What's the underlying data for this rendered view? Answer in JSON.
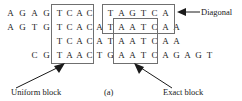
{
  "figure": {
    "caption": "(a)",
    "rows": [
      {
        "id": "row-1",
        "start_col": 0,
        "bases": [
          "A",
          "G",
          "A",
          "G",
          "T",
          "C",
          "A",
          "C",
          "",
          "",
          "T",
          "A",
          "G",
          "T",
          "C",
          "A"
        ]
      },
      {
        "id": "row-2",
        "start_col": 0,
        "bases": [
          "A",
          "G",
          "T",
          "G",
          "T",
          "C",
          "A",
          "C",
          "A",
          "T",
          "A",
          "A",
          "T",
          "C",
          "A",
          "A"
        ]
      },
      {
        "id": "row-3",
        "start_col": 4,
        "bases": [
          "T",
          "C",
          "A",
          "C",
          "A",
          "T",
          "A",
          "A",
          "T",
          "C",
          "A",
          "A"
        ]
      },
      {
        "id": "row-4",
        "start_col": 2,
        "bases": [
          "C",
          "G",
          "T",
          "A",
          "A",
          "C",
          "T",
          "G",
          "A",
          "A",
          "T",
          "C",
          "A",
          "G",
          "A",
          "G",
          "T"
        ]
      }
    ],
    "blocks": [
      {
        "id": "uniform-block",
        "label": "Uniform block",
        "columns": "4-7",
        "rows": "1-4"
      },
      {
        "id": "diagonal-block",
        "label": "Diagonal",
        "columns": "10-15",
        "rows": "1-2"
      },
      {
        "id": "exact-block",
        "label": "Exact block",
        "columns": "10-13",
        "rows": "2-4"
      }
    ],
    "annotations": {
      "uniform": "Uniform block",
      "diagonal": "Diagonal",
      "exact": "Exact block",
      "caption": "(a)"
    },
    "colors": {
      "text": "#1a1a1a",
      "box_stroke": "#6f6f6f",
      "arrow": "#1a1a1a",
      "background": "#ffffff"
    }
  }
}
